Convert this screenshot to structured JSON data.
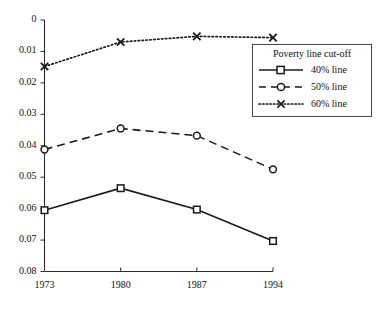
{
  "chart_data": {
    "type": "line",
    "title": "",
    "subtitle": "",
    "xlabel": "",
    "ylabel": "",
    "categories": [
      "1973",
      "1980",
      "1987",
      "1994"
    ],
    "x": [
      1973,
      1980,
      1987,
      1994
    ],
    "xlim": [
      1973,
      1994
    ],
    "ylim": [
      0,
      0.08
    ],
    "grid": false,
    "legend_position": "upper-right",
    "legend_title": "Poverty line cut-off",
    "xticks": [
      "1973",
      "1980",
      "1987",
      "1994"
    ],
    "yticks": [
      "0",
      "0.01",
      "0.02",
      "0.03",
      "0.04",
      "0.05",
      "0.06",
      "0.07",
      "0.08"
    ],
    "ytick_values": [
      0,
      0.01,
      0.02,
      0.03,
      0.04,
      0.05,
      0.06,
      0.07,
      0.08
    ],
    "series": [
      {
        "name": "40% line",
        "values": [
          0.0195,
          0.0265,
          0.0197,
          0.0097
        ],
        "marker": "square",
        "linestyle": "solid",
        "color": "#1a1a1a"
      },
      {
        "name": "50% line",
        "values": [
          0.0388,
          0.0455,
          0.0432,
          0.0325
        ],
        "marker": "circle",
        "linestyle": "dashed",
        "color": "#1a1a1a"
      },
      {
        "name": "60% line",
        "values": [
          0.0652,
          0.073,
          0.0748,
          0.0744
        ],
        "marker": "cross",
        "linestyle": "dotted",
        "color": "#1a1a1a"
      }
    ]
  },
  "legend": {
    "title": "Poverty line cut-off",
    "entries": [
      {
        "label": "40% line"
      },
      {
        "label": "50% line"
      },
      {
        "label": "60% line"
      }
    ]
  },
  "axes": {
    "y_ticks": [
      "0.08",
      "0.07",
      "0.06",
      "0.05",
      "0.04",
      "0.03",
      "0.02",
      "0.01",
      "0"
    ],
    "x_ticks": [
      "1973",
      "1980",
      "1987",
      "1994"
    ]
  }
}
